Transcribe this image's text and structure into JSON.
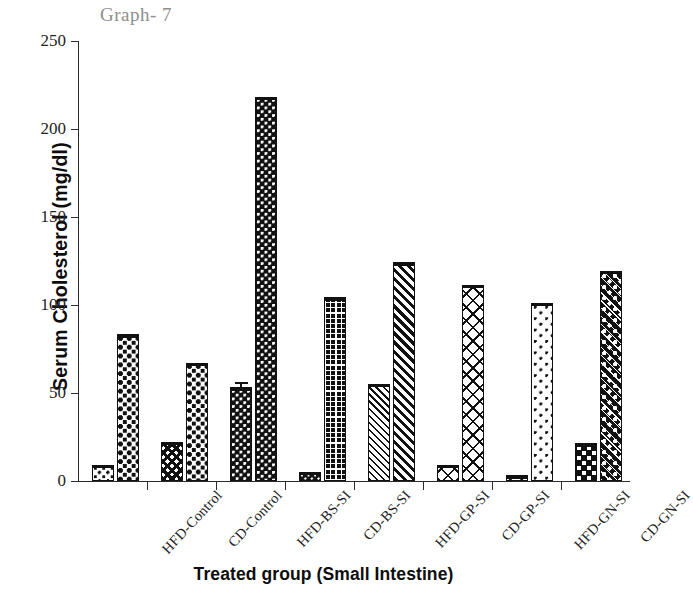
{
  "chart_data": {
    "type": "bar",
    "title": "Graph- 7",
    "xlabel": "Treated group (Small Intestine)",
    "ylabel": "Serum Cholesterol (mg/dl)",
    "ylim": [
      0,
      250
    ],
    "ytick_labels": [
      "0",
      "50",
      "100",
      "150",
      "200",
      "250"
    ],
    "ytick_values": [
      0,
      50,
      100,
      150,
      200,
      250
    ],
    "grid": false,
    "legend": "none",
    "categories": [
      "HFD-Control",
      "CD-Control",
      "HFD-BS-SI",
      "CD-BS-SI",
      "HFD-GP-SI",
      "CD-GP-SI",
      "HFD-GN-SI",
      "CD-GN-SI"
    ],
    "series": [
      {
        "name": "Bar A",
        "values": [
          9,
          22,
          53,
          5,
          55,
          9,
          3,
          21
        ],
        "errors": [
          0,
          0,
          3,
          0,
          0,
          0,
          0,
          0
        ],
        "patterns": [
          "p-dot-lt",
          "p-xhatch-dk",
          "p-dot-dk",
          "p-dot-dk-fine",
          "p-diag-lt",
          "p-xhatch-lt",
          "p-sparse-dot",
          "p-check-dk"
        ]
      },
      {
        "name": "Bar B",
        "values": [
          83,
          67,
          218,
          104,
          124,
          111,
          101,
          119
        ],
        "errors": [
          0,
          0,
          0,
          0,
          0,
          0,
          0,
          0
        ],
        "patterns": [
          "p-check-md",
          "p-check-md",
          "p-dot-dk",
          "p-grid-dk",
          "p-diag-md",
          "p-xhatch-lt",
          "p-sparse-dot",
          "p-floral-dk"
        ]
      }
    ]
  }
}
